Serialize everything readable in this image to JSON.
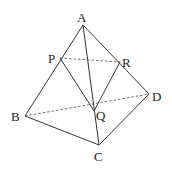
{
  "diagram": {
    "type": "tetrahedron",
    "points": {
      "A": {
        "label": "A",
        "x": 83,
        "y": 25,
        "lx": 77,
        "ly": 22
      },
      "B": {
        "label": "B",
        "x": 25,
        "y": 116,
        "lx": 11,
        "ly": 121
      },
      "C": {
        "label": "C",
        "x": 99,
        "y": 145,
        "lx": 94,
        "ly": 161
      },
      "D": {
        "label": "D",
        "x": 149,
        "y": 94,
        "lx": 152,
        "ly": 101
      },
      "P": {
        "label": "P",
        "x": 60,
        "y": 58,
        "lx": 48,
        "ly": 63
      },
      "Q": {
        "label": "Q",
        "x": 94,
        "y": 111,
        "lx": 96,
        "ly": 120
      },
      "R": {
        "label": "R",
        "x": 120,
        "y": 62,
        "lx": 122,
        "ly": 67
      }
    },
    "solid_edges": [
      [
        "A",
        "B"
      ],
      [
        "A",
        "C"
      ],
      [
        "A",
        "D"
      ],
      [
        "B",
        "C"
      ],
      [
        "C",
        "D"
      ],
      [
        "P",
        "Q"
      ],
      [
        "R",
        "Q"
      ]
    ],
    "dashed_edges": [
      [
        "P",
        "R"
      ],
      [
        "B",
        "D"
      ]
    ]
  }
}
